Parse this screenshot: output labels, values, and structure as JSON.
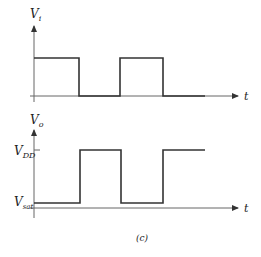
{
  "input_plot": {
    "y_label": "V",
    "y_sub": "i",
    "x_label": "t"
  },
  "output_plot": {
    "y_label": "V",
    "y_sub": "o",
    "x_label": "t",
    "high_label": "V",
    "high_sub": "DD",
    "low_label": "V",
    "low_sub": "sat"
  },
  "caption": "(c)",
  "colors": {
    "line": "#333333",
    "axis": "#555555"
  }
}
